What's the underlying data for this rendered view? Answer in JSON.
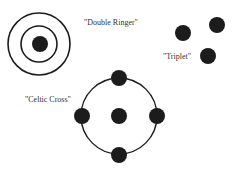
{
  "colors": {
    "ink": "#1c1c1c",
    "background": "#ffffff",
    "text": "#333333"
  },
  "patterns": [
    {
      "name": "Double Ringer",
      "label": "\"Double Ringer\""
    },
    {
      "name": "Triplet",
      "label": "\"Triplet\""
    },
    {
      "name": "Celtic Cross",
      "label": "\"Celtic Cross\""
    }
  ]
}
